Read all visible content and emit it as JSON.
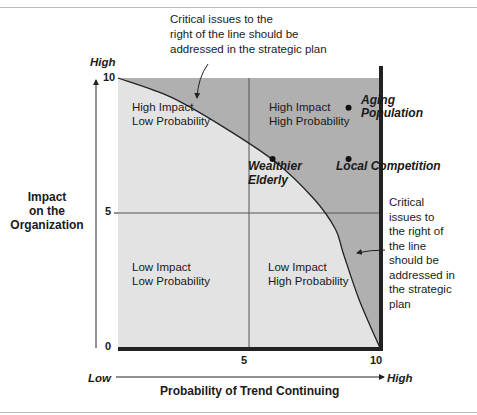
{
  "chart_data": {
    "type": "scatter",
    "title": "",
    "xlabel": "Probability of Trend Continuing",
    "ylabel": "Impact on the Organization",
    "xlim": [
      0,
      10
    ],
    "ylim": [
      0,
      10
    ],
    "x_ticks": [
      "5",
      "10"
    ],
    "y_ticks": [
      "10",
      "5",
      "0"
    ],
    "x_axis_low_label": "Low",
    "x_axis_high_label": "High",
    "y_axis_high_label": "High",
    "quadrants": [
      {
        "id": "top-left",
        "line1": "High Impact",
        "line2": "Low Probability"
      },
      {
        "id": "top-right",
        "line1": "High Impact",
        "line2": "High Probability"
      },
      {
        "id": "bottom-left",
        "line1": "Low Impact",
        "line2": "Low Probability"
      },
      {
        "id": "bottom-right",
        "line1": "Low Impact",
        "line2": "High Probability"
      }
    ],
    "points": [
      {
        "label_line1": "Aging",
        "label_line2": "Population",
        "x": 8.8,
        "y": 8.9
      },
      {
        "label_line1": "Local Competition",
        "label_line2": "",
        "x": 8.8,
        "y": 7.0
      },
      {
        "label_line1": "Wealthier",
        "label_line2": "Elderly",
        "x": 5.9,
        "y": 7.0
      }
    ],
    "critical_curve": [
      [
        0,
        10
      ],
      [
        2,
        9.3
      ],
      [
        4,
        8.2
      ],
      [
        6,
        6.9
      ],
      [
        7.5,
        5.5
      ],
      [
        8.3,
        4.4
      ],
      [
        8.6,
        3.5
      ],
      [
        9.2,
        1.8
      ],
      [
        10,
        0
      ]
    ],
    "annotations": {
      "top": [
        "Critical issues to the",
        "right of the line should be",
        "addressed in the strategic plan"
      ],
      "right": [
        "Critical",
        "issues to",
        "the right of",
        "the line",
        "should be",
        "addressed in",
        "the strategic",
        "plan"
      ]
    },
    "colors": {
      "above_curve": "#b0b0b0",
      "below_curve": "#e3e3e3",
      "frame_dark": "#222222"
    }
  }
}
